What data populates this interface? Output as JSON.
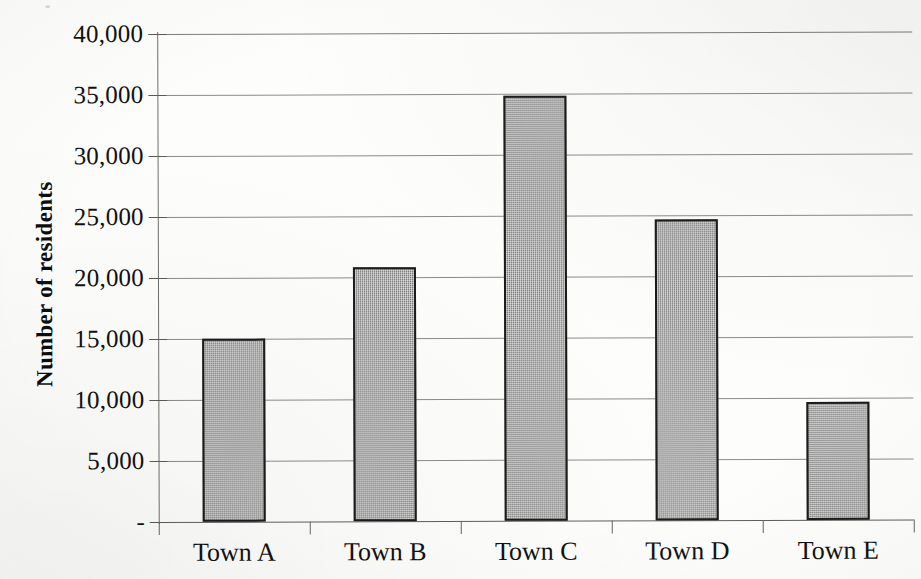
{
  "chart_data": {
    "type": "bar",
    "title": "",
    "subtitle": "",
    "xlabel": "",
    "ylabel": "Number of residents",
    "categories": [
      "Town A",
      "Town B",
      "Town C",
      "Town D",
      "Town E"
    ],
    "values": [
      15000,
      20800,
      34800,
      24700,
      9700
    ],
    "ylim": [
      0,
      40000
    ],
    "ytick_values": [
      0,
      5000,
      10000,
      15000,
      20000,
      25000,
      30000,
      35000,
      40000
    ],
    "ytick_labels": [
      "-",
      "5,000",
      "10,000",
      "15,000",
      "20,000",
      "25,000",
      "30,000",
      "35,000",
      "40,000"
    ],
    "grid": true,
    "legend": false,
    "legend_position": "none",
    "series": [
      {
        "name": "Number of residents",
        "values": [
          15000,
          20800,
          34800,
          24700,
          9700
        ],
        "color": "#8a8a8a",
        "edge_color": "#1c1c1c",
        "fill_pattern": "50-percent-gray-dither"
      }
    ]
  },
  "axes": {
    "y_title": "Number of residents",
    "y_title_bold": true,
    "zero_label_style": "accounting-dash"
  },
  "colors": {
    "bar_fill": "#8a8a8a",
    "bar_edge": "#1c1c1c",
    "gridline": "#8b8b8b",
    "axis_line": "#6f6f6f",
    "text": "#111111",
    "background": "#fdfdfc"
  }
}
